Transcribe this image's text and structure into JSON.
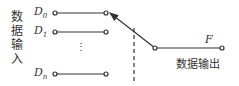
{
  "diagram": {
    "type": "multiplexer-switch",
    "input_group_label": "数据输入",
    "inputs": [
      {
        "name": "D",
        "sub": "0"
      },
      {
        "name": "D",
        "sub": "1"
      },
      {
        "name": "D",
        "sub": "n"
      }
    ],
    "ellipsis": "⋮",
    "output": {
      "name": "F",
      "label": "数据输出"
    },
    "colors": {
      "stroke": "#333333"
    }
  }
}
